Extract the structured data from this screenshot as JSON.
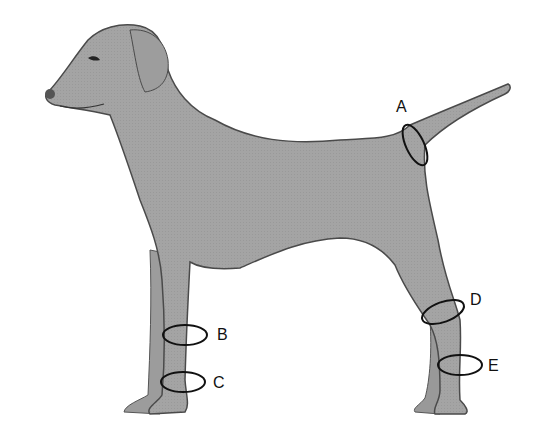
{
  "figure": {
    "body_color": "#a3a3a3",
    "outline_color": "#4a4a4a",
    "marker_color": "#111111",
    "markers": [
      {
        "label": "A",
        "location": "tail base"
      },
      {
        "label": "B",
        "location": "front leg upper (forearm)"
      },
      {
        "label": "C",
        "location": "front leg lower (carpus/pastern)"
      },
      {
        "label": "D",
        "location": "hind leg hock (upper)"
      },
      {
        "label": "E",
        "location": "hind leg lower (metatarsus)"
      }
    ]
  }
}
